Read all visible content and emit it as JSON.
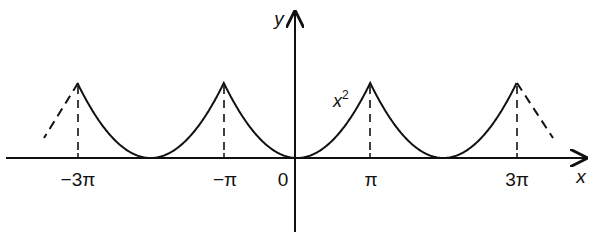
{
  "diagram": {
    "title": "",
    "axes": {
      "x_label": "x",
      "y_label": "y",
      "origin_label": "0"
    },
    "x_ticks": [
      {
        "label": "−3π",
        "value": -3
      },
      {
        "label": "−π",
        "value": -1
      },
      {
        "label": "π",
        "value": 1
      },
      {
        "label": "3π",
        "value": 3
      }
    ],
    "curve_label": "x²",
    "curve_label_base": "x",
    "curve_label_exp": "2",
    "colors": {
      "stroke": "#111111",
      "background": "#ffffff"
    }
  }
}
